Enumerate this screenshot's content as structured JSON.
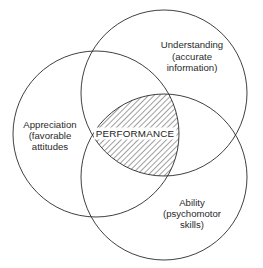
{
  "diagram": {
    "type": "venn",
    "circles": [
      {
        "id": "understanding",
        "label_lines": [
          "Understanding",
          "(accurate",
          "information)"
        ],
        "cx": 164,
        "cy": 93,
        "r": 83,
        "label_x": 192,
        "label_y": [
          48,
          60,
          71
        ]
      },
      {
        "id": "appreciation",
        "label_lines": [
          "Appreciation",
          "(favorable",
          "attitudes"
        ],
        "cx": 96,
        "cy": 134,
        "r": 83,
        "label_x": 50,
        "label_y": [
          128,
          139,
          150
        ]
      },
      {
        "id": "ability",
        "label_lines": [
          "Ability",
          "(psychomotor",
          "skills)"
        ],
        "cx": 164,
        "cy": 177,
        "r": 83,
        "label_x": 192,
        "label_y": [
          206,
          217,
          228
        ]
      }
    ],
    "intersection": {
      "label": "PERFORMANCE",
      "fill_pattern": "diagonal-hatch",
      "label_x": 135,
      "label_y": 137
    },
    "colors": {
      "stroke": "#2a2a2a",
      "background": "#ffffff",
      "hatch": "#2a2a2a"
    }
  }
}
